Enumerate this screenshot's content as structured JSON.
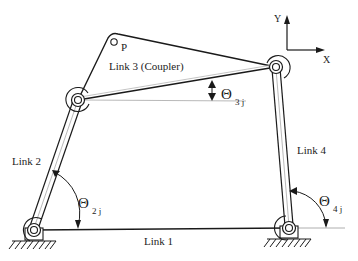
{
  "diagram": {
    "type": "four-bar linkage",
    "colors": {
      "line": "#1a1a1a",
      "thin_line": "#555555",
      "reference_line": "#9a9a9a",
      "text": "#222222",
      "background": "#ffffff"
    },
    "labels": {
      "point_p": "P",
      "link1": "Link 1",
      "link2": "Link 2",
      "link3": "Link 3 (Coupler)",
      "link4": "Link 4",
      "axis_x": "X",
      "axis_y": "Y"
    },
    "angles": {
      "theta2": {
        "symbol": "Θ",
        "subscript": "2 j"
      },
      "theta3": {
        "symbol": "Θ",
        "subscript": "3 j"
      },
      "theta4": {
        "symbol": "Θ",
        "subscript": "4 j"
      }
    },
    "joints": {
      "ground_pivot_link2": {
        "x": 34,
        "y": 230
      },
      "joint_link2_link3": {
        "x": 78,
        "y": 100
      },
      "coupler_apex": {
        "x": 112,
        "y": 35
      },
      "coupler_point_p": {
        "x": 114,
        "y": 42
      },
      "joint_link3_link4": {
        "x": 276,
        "y": 67
      },
      "ground_pivot_link4": {
        "x": 289,
        "y": 228
      }
    }
  }
}
